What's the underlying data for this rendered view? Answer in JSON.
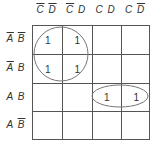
{
  "kmap": {
    "columns": [
      {
        "a": "C",
        "a_bar": true,
        "b": "D",
        "b_bar": true
      },
      {
        "a": "C",
        "a_bar": true,
        "b": "D",
        "b_bar": false
      },
      {
        "a": "C",
        "a_bar": false,
        "b": "D",
        "b_bar": false
      },
      {
        "a": "C",
        "a_bar": false,
        "b": "D",
        "b_bar": true
      }
    ],
    "rows": [
      {
        "a": "A",
        "a_bar": true,
        "b": "B",
        "b_bar": true
      },
      {
        "a": "A",
        "a_bar": true,
        "b": "B",
        "b_bar": false
      },
      {
        "a": "A",
        "a_bar": false,
        "b": "B",
        "b_bar": false
      },
      {
        "a": "A",
        "a_bar": false,
        "b": "B",
        "b_bar": true
      }
    ],
    "cells": [
      [
        "1",
        "1",
        "",
        ""
      ],
      [
        "1",
        "1",
        "",
        ""
      ],
      [
        "",
        "",
        "1",
        "1"
      ],
      [
        "",
        "",
        "",
        ""
      ]
    ],
    "groups": [
      {
        "type": "circle",
        "cells": [
          [
            0,
            0
          ],
          [
            0,
            1
          ],
          [
            1,
            0
          ],
          [
            1,
            1
          ]
        ]
      },
      {
        "type": "ellipse",
        "cells": [
          [
            2,
            2
          ],
          [
            2,
            3
          ]
        ]
      }
    ],
    "line_color": "#555555"
  }
}
